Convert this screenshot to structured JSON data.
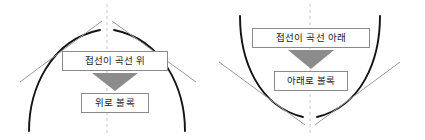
{
  "figure": {
    "background_color": "#ffffff",
    "width": 425,
    "height": 140,
    "curve_color": "#141414",
    "tangent_color": "#9a9a9a",
    "axis_color": "#c8c8c8",
    "box_border_color": "#8a8a8a",
    "box_fill_color": "#ffffff",
    "arrow_color": "#8c8c8c",
    "text_color": "#1c1c1c"
  },
  "panels": [
    {
      "id": "concave-down",
      "curve_shape": "arc-opening-downward",
      "boxes": {
        "condition": "접선이 곡선 위",
        "conclusion": "위로 볼록"
      },
      "arrow": "down-arrow"
    },
    {
      "id": "concave-up",
      "curve_shape": "arc-opening-upward",
      "boxes": {
        "condition": "접선이 곡선 아래",
        "conclusion": "아래로 볼록"
      },
      "arrow": "down-arrow"
    }
  ]
}
